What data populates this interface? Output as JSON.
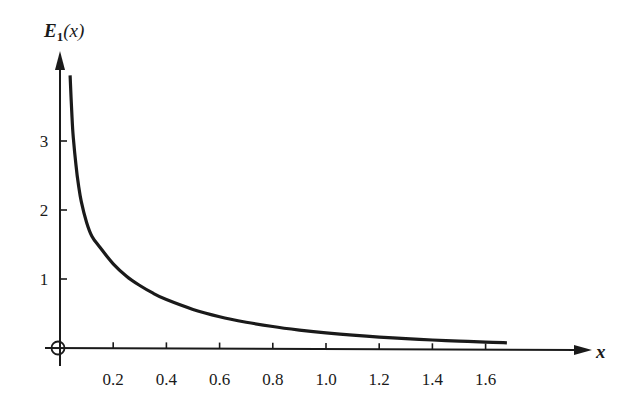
{
  "chart_data": {
    "type": "line",
    "title": "",
    "xlabel": "x",
    "ylabel": "E₁(x)",
    "ylabel_parts": {
      "main": "E",
      "sub": "1",
      "arg": "(x)"
    },
    "xlim": [
      0,
      1.9
    ],
    "ylim": [
      0,
      4.2
    ],
    "grid": false,
    "legend": null,
    "x_ticks": [
      0.2,
      0.4,
      0.6,
      0.8,
      1.0,
      1.2,
      1.4,
      1.6
    ],
    "x_tick_labels": [
      "0.2",
      "0.4",
      "0.6",
      "0.8",
      "1.0",
      "1.2",
      "1.4",
      "1.6"
    ],
    "y_ticks": [
      1,
      2,
      3
    ],
    "y_tick_labels": [
      "1",
      "2",
      "3"
    ],
    "origin_marker": "circled-plus",
    "series": [
      {
        "name": "E1(x)",
        "color": "#1a1a1a",
        "x": [
          0.038,
          0.045,
          0.05,
          0.06,
          0.07,
          0.08,
          0.1,
          0.12,
          0.15,
          0.2,
          0.25,
          0.3,
          0.35,
          0.4,
          0.5,
          0.6,
          0.7,
          0.8,
          0.9,
          1.0,
          1.1,
          1.2,
          1.3,
          1.4,
          1.5,
          1.6,
          1.68
        ],
        "y": [
          3.95,
          3.35,
          3.05,
          2.65,
          2.35,
          2.12,
          1.82,
          1.62,
          1.46,
          1.22,
          1.04,
          0.906,
          0.794,
          0.702,
          0.56,
          0.454,
          0.374,
          0.311,
          0.26,
          0.219,
          0.186,
          0.158,
          0.135,
          0.116,
          0.1,
          0.086,
          0.076
        ]
      }
    ]
  }
}
